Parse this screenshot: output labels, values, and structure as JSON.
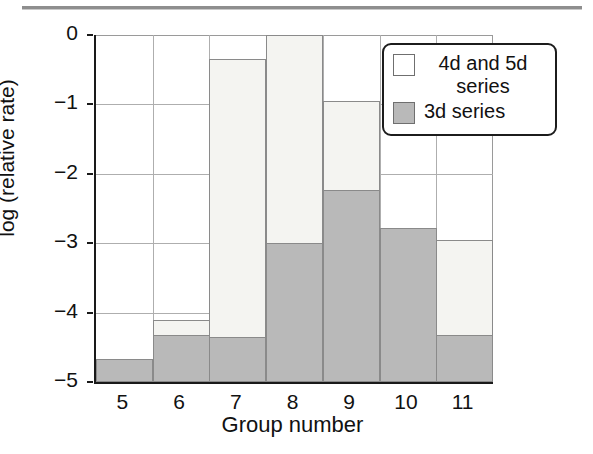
{
  "chart_data": {
    "type": "bar",
    "stacked": true,
    "title": "",
    "xlabel": "Group number",
    "ylabel": "log (relative rate)",
    "categories": [
      "5",
      "6",
      "7",
      "8",
      "9",
      "10",
      "11"
    ],
    "ylim": [
      -5,
      0
    ],
    "yticks": [
      "0",
      "−1",
      "−2",
      "−3",
      "−4",
      "−5"
    ],
    "ytick_values": [
      0,
      -1,
      -2,
      -3,
      -4,
      -5
    ],
    "grid": true,
    "legend_position": "top-right",
    "series": [
      {
        "name": "4d and 5d series",
        "color": "#f4f4f1",
        "values": [
          -4.67,
          -4.1,
          -0.35,
          0.0,
          -0.95,
          -2.78,
          -2.95
        ]
      },
      {
        "name": "3d series",
        "color": "#b9b9b9",
        "values": [
          -4.67,
          -4.32,
          -4.35,
          -3.0,
          -2.23,
          -2.78,
          -4.32
        ]
      }
    ],
    "legend_entries": [
      {
        "label": "4d and 5d series",
        "swatch": "white"
      },
      {
        "label": "3d series",
        "swatch": "gray"
      }
    ]
  }
}
